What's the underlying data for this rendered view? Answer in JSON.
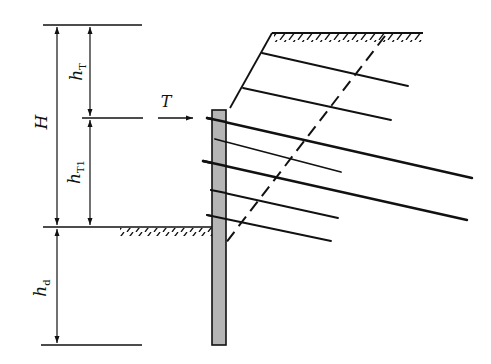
{
  "figure": {
    "type": "anchored retaining wall cross-section (pile-anchor support with slope)",
    "labels": {
      "H": "H",
      "hT": "h",
      "hT_sub": "T",
      "hT1": "h",
      "hT1_sub": "T1",
      "hd": "h",
      "hd_sub": "d",
      "T": "T"
    },
    "colors": {
      "line": "#111111",
      "wall_fill": "#b5b5b5",
      "background": "#ffffff"
    },
    "top_strip_text": "（cropped text line, illegible）"
  }
}
